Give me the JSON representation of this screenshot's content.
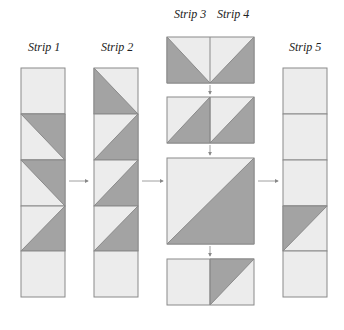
{
  "labels": {
    "strip1": "Strip 1",
    "strip2": "Strip 2",
    "strip3": "Strip 3",
    "strip4": "Strip 4",
    "strip5": "Strip 5"
  },
  "colors": {
    "light": "#ececec",
    "dark": "#a3a3a3",
    "stroke": "#8a8a8a",
    "arrow": "#888888"
  }
}
